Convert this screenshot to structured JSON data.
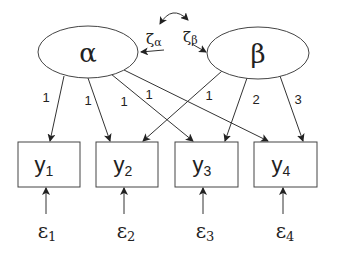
{
  "diagram": {
    "type": "structural-equation-model",
    "latent_factors": [
      {
        "id": "alpha",
        "label": "α",
        "disturbance": "ζ",
        "disturbance_sub": "α"
      },
      {
        "id": "beta",
        "label": "β",
        "disturbance": "ζ",
        "disturbance_sub": "β"
      }
    ],
    "indicators": [
      {
        "id": "y1",
        "label": "y",
        "sub": "1",
        "error": "ε",
        "error_sub": "1"
      },
      {
        "id": "y2",
        "label": "y",
        "sub": "2",
        "error": "ε",
        "error_sub": "2"
      },
      {
        "id": "y3",
        "label": "y",
        "sub": "3",
        "error": "ε",
        "error_sub": "3"
      },
      {
        "id": "y4",
        "label": "y",
        "sub": "4",
        "error": "ε",
        "error_sub": "4"
      }
    ],
    "loadings": {
      "alpha": [
        "1",
        "1",
        "1",
        "1"
      ],
      "beta": [
        "1",
        "2",
        "3"
      ]
    },
    "covariance": "ζα ↔ ζβ"
  }
}
